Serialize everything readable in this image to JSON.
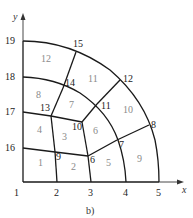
{
  "caption": "b)",
  "axes": {
    "x_label": "x",
    "y_label": "y"
  },
  "nodes": [
    {
      "id": "1",
      "x": 23,
      "y": 182,
      "lx": 14,
      "ly": 196
    },
    {
      "id": "2",
      "x": 57,
      "y": 182,
      "lx": 54,
      "ly": 196
    },
    {
      "id": "3",
      "x": 91,
      "y": 182,
      "lx": 88,
      "ly": 196
    },
    {
      "id": "4",
      "x": 126,
      "y": 182,
      "lx": 123,
      "ly": 196
    },
    {
      "id": "5",
      "x": 159,
      "y": 182,
      "lx": 156,
      "ly": 196
    },
    {
      "id": "6",
      "x": 88,
      "y": 156,
      "lx": 90,
      "ly": 163
    },
    {
      "id": "7",
      "x": 117,
      "y": 140,
      "lx": 119,
      "ly": 148
    },
    {
      "id": "8",
      "x": 149,
      "y": 125,
      "lx": 151,
      "ly": 128
    },
    {
      "id": "9",
      "x": 55,
      "y": 152,
      "lx": 56,
      "ly": 160
    },
    {
      "id": "10",
      "x": 82,
      "y": 122,
      "lx": 72,
      "ly": 130
    },
    {
      "id": "11",
      "x": 97,
      "y": 104,
      "lx": 101,
      "ly": 109
    },
    {
      "id": "12",
      "x": 120,
      "y": 80,
      "lx": 123,
      "ly": 82
    },
    {
      "id": "13",
      "x": 51,
      "y": 116,
      "lx": 40,
      "ly": 111
    },
    {
      "id": "14",
      "x": 63,
      "y": 88,
      "lx": 65,
      "ly": 86
    },
    {
      "id": "15",
      "x": 76,
      "y": 52,
      "lx": 73,
      "ly": 47
    },
    {
      "id": "16",
      "x": 23,
      "y": 148,
      "lx": 5,
      "ly": 151
    },
    {
      "id": "17",
      "x": 23,
      "y": 112,
      "lx": 5,
      "ly": 115
    },
    {
      "id": "18",
      "x": 23,
      "y": 77,
      "lx": 5,
      "ly": 80
    },
    {
      "id": "19",
      "x": 23,
      "y": 41,
      "lx": 5,
      "ly": 44
    }
  ],
  "elements": [
    {
      "id": "1",
      "x": 38,
      "y": 166
    },
    {
      "id": "2",
      "x": 71,
      "y": 170
    },
    {
      "id": "3",
      "x": 62,
      "y": 140
    },
    {
      "id": "4",
      "x": 37,
      "y": 133
    },
    {
      "id": "5",
      "x": 106,
      "y": 166
    },
    {
      "id": "6",
      "x": 93,
      "y": 134
    },
    {
      "id": "7",
      "x": 69,
      "y": 108
    },
    {
      "id": "8",
      "x": 36,
      "y": 98
    },
    {
      "id": "9",
      "x": 137,
      "y": 162
    },
    {
      "id": "10",
      "x": 123,
      "y": 113
    },
    {
      "id": "11",
      "x": 88,
      "y": 82
    },
    {
      "id": "12",
      "x": 41,
      "y": 62
    }
  ],
  "mesh_lines": {
    "straight": [
      [
        "1",
        "5"
      ],
      [
        "1",
        "19"
      ],
      [
        "16",
        "9"
      ],
      [
        "9",
        "6"
      ],
      [
        "6",
        "7"
      ],
      [
        "7",
        "8"
      ],
      [
        "17",
        "13"
      ],
      [
        "13",
        "10"
      ],
      [
        "10",
        "11"
      ],
      [
        "11",
        "12"
      ],
      [
        "2",
        "9"
      ],
      [
        "9",
        "13"
      ],
      [
        "13",
        "14"
      ],
      [
        "14",
        "15"
      ],
      [
        "3",
        "6"
      ],
      [
        "6",
        "10"
      ]
    ],
    "curved": [
      "M23,41 Q70,41 110,70 Q145,100 155,140 Q159,160 159,182",
      "M23,77 Q55,78 80,93 Q108,112 118,140 Q125,160 126,182"
    ]
  }
}
